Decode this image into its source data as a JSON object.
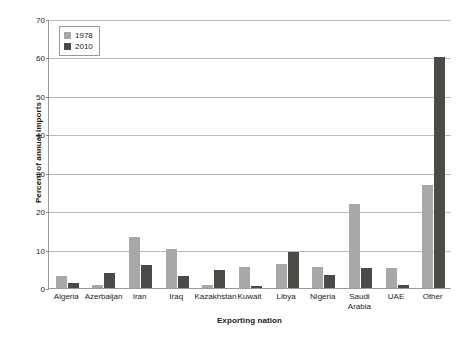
{
  "chart_data": {
    "type": "bar",
    "title": "",
    "subtitle": "",
    "xlabel": "Exporting nation",
    "ylabel": "Percent of annual imports",
    "ylim": [
      0,
      70
    ],
    "ytick_step": 10,
    "yticks": [
      0,
      10,
      20,
      30,
      40,
      50,
      60,
      70
    ],
    "ytick_labels": [
      "0",
      "10",
      "20",
      "30",
      "40",
      "50",
      "60",
      "70"
    ],
    "grid": "horizontal",
    "legend_position": "top-left",
    "categories": [
      "Algeria",
      "Azerbaijan",
      "Iran",
      "Iraq",
      "Kazakhstan",
      "Kuwait",
      "Libya",
      "Nigeria",
      "Saudi\nArabia",
      "UAE",
      "Other"
    ],
    "series": [
      {
        "name": "1978",
        "color": "#a8a8a8",
        "values": [
          3.0,
          0.9,
          13.3,
          10.2,
          0.9,
          5.4,
          6.3,
          5.4,
          21.8,
          5.3,
          26.8
        ]
      },
      {
        "name": "2010",
        "color": "#4a4a46",
        "values": [
          1.4,
          3.8,
          6.1,
          3.0,
          4.7,
          0.4,
          9.4,
          3.4,
          5.2,
          0.7,
          60.0
        ]
      }
    ]
  },
  "legend": {
    "entries": [
      {
        "label": "1978",
        "color": "#a8a8a8"
      },
      {
        "label": "2010",
        "color": "#4a4a46"
      }
    ]
  },
  "axes": {
    "y_title": "Percent of annual imports",
    "x_title": "Exporting nation"
  }
}
